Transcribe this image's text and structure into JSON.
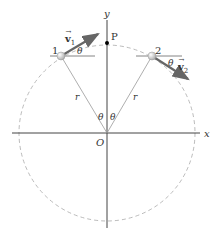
{
  "diagram": {
    "axes": {
      "x_label": "x",
      "y_label": "y",
      "origin_label": "O"
    },
    "point_p": {
      "label": "P"
    },
    "particle_1": {
      "label": "1",
      "velocity_label": "v",
      "velocity_subscript": "1",
      "angle_label": "θ"
    },
    "particle_2": {
      "label": "2",
      "velocity_label": "v",
      "velocity_subscript": "2",
      "angle_label": "θ"
    },
    "radius_labels": [
      "r",
      "r"
    ],
    "center_angles": [
      "θ",
      "θ"
    ],
    "colors": {
      "axis": "#444444",
      "circle": "#aaaaaa",
      "radius": "#999999",
      "arrow": "#666666",
      "particle": "#cccccc"
    }
  }
}
